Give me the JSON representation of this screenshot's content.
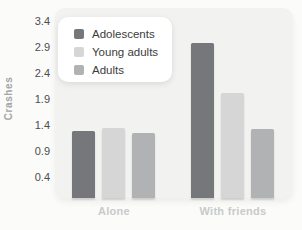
{
  "chart_data": {
    "type": "bar",
    "title": "",
    "xlabel": "",
    "ylabel": "Crashes",
    "categories": [
      "Alone",
      "With friends"
    ],
    "series": [
      {
        "name": "Adolescents",
        "color": "#76777a",
        "values": [
          1.28,
          2.98
        ]
      },
      {
        "name": "Young adults",
        "color": "#d5d6d5",
        "values": [
          1.35,
          2.02
        ]
      },
      {
        "name": "Adults",
        "color": "#b0b2b4",
        "values": [
          1.25,
          1.33
        ]
      }
    ],
    "yticks": [
      3.4,
      2.9,
      2.4,
      1.9,
      1.4,
      0.9,
      0.4
    ],
    "ylim": [
      0,
      3.6
    ],
    "grid": false,
    "legend_position": "upper-left"
  },
  "colors": {
    "page_bg": "#fbfbfa",
    "plot_bg": "#f2f2f1",
    "tick_text": "#4d4d4f",
    "xlabel_text": "#c9cacb",
    "ylabel_text": "#a3a4a6",
    "legend_text": "#3c3c3e",
    "legend_bg": "#ffffff"
  }
}
